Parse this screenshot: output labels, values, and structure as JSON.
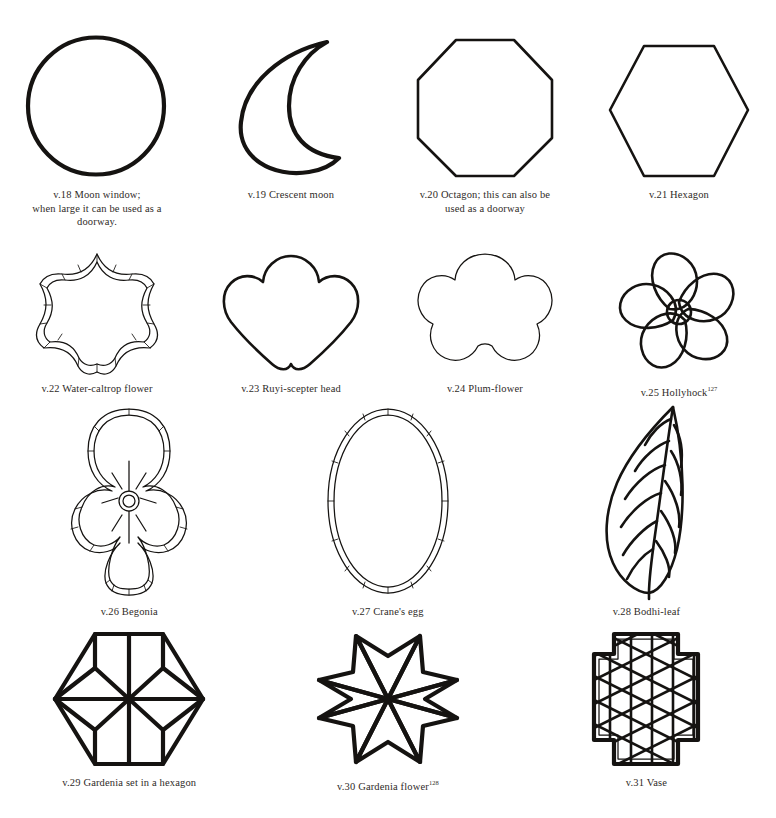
{
  "plate": {
    "title": "Lattice window shapes plate",
    "background_color": "#ffffff",
    "ink_color": "#151311",
    "caption_color": "#2f2b28",
    "figure_count": 14,
    "row_count": 4
  },
  "figures": [
    {
      "id": "v.18",
      "number": "v.18",
      "name": "Moon window",
      "icon": "circle-shape",
      "caption": "v.18  Moon window;\nwhen large it can be used as a\ndoorway.",
      "row": 1
    },
    {
      "id": "v.19",
      "number": "v.19",
      "name": "Crescent moon",
      "icon": "crescent-moon-shape",
      "caption": "v.19  Crescent moon",
      "row": 1
    },
    {
      "id": "v.20",
      "number": "v.20",
      "name": "Octagon",
      "icon": "octagon-shape",
      "caption": "v.20  Octagon; this can also be\nused as a doorway",
      "row": 1
    },
    {
      "id": "v.21",
      "number": "v.21",
      "name": "Hexagon",
      "icon": "hexagon-shape",
      "caption": "v.21  Hexagon",
      "row": 1
    },
    {
      "id": "v.22",
      "number": "v.22",
      "name": "Water-caltrop flower",
      "icon": "seven-point-star-shape",
      "caption": "v.22  Water-caltrop flower",
      "row": 2
    },
    {
      "id": "v.23",
      "number": "v.23",
      "name": "Ruyi-scepter head",
      "icon": "ruyi-scepter-head-shape",
      "caption": "v.23  Ruyi-scepter head",
      "row": 2
    },
    {
      "id": "v.24",
      "number": "v.24",
      "name": "Plum-flower",
      "icon": "plum-flower-shape",
      "caption": "v.24  Plum-flower",
      "row": 2
    },
    {
      "id": "v.25",
      "number": "v.25",
      "name": "Hollyhock",
      "icon": "hollyhock-pinwheel-shape",
      "caption": "v.25  Hollyhock",
      "footnote": "127",
      "row": 2
    },
    {
      "id": "v.26",
      "number": "v.26",
      "name": "Begonia",
      "icon": "begonia-quatrefoil-shape",
      "caption": "v.26  Begonia",
      "row": 3
    },
    {
      "id": "v.27",
      "number": "v.27",
      "name": "Crane's egg",
      "icon": "oval-shape",
      "caption": "v.27  Crane's egg",
      "row": 3
    },
    {
      "id": "v.28",
      "number": "v.28",
      "name": "Bodhi-leaf",
      "icon": "bodhi-leaf-shape",
      "caption": "v.28  Bodhi-leaf",
      "row": 3
    },
    {
      "id": "v.29",
      "number": "v.29",
      "name": "Gardenia set in a hexagon",
      "icon": "gardenia-hexagon-shape",
      "caption": "v.29  Gardenia set in a hexagon",
      "row": 4
    },
    {
      "id": "v.30",
      "number": "v.30",
      "name": "Gardenia flower",
      "icon": "six-point-star-shape",
      "caption": "v.30  Gardenia flower",
      "footnote": "128",
      "row": 4
    },
    {
      "id": "v.31",
      "number": "v.31",
      "name": "Vase",
      "icon": "vase-lattice-shape",
      "caption": "v.31  Vase",
      "row": 4
    }
  ]
}
